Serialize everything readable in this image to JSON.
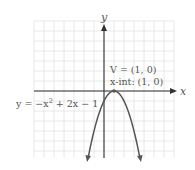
{
  "chart_data": {
    "type": "line",
    "title": "",
    "xlabel": "x",
    "ylabel": "y",
    "xlim": [
      -7,
      7
    ],
    "ylim": [
      -6.7,
      7
    ],
    "grid": true,
    "grid_step": 1,
    "series": [
      {
        "name": "y = -x^2 + 2x - 1",
        "equation": "y = -(x - 1)^2",
        "x": [
          -1.6,
          -1,
          0,
          1,
          2,
          3,
          3.6
        ],
        "y": [
          -6.76,
          -4,
          -1,
          0,
          -1,
          -4,
          -6.76
        ]
      }
    ],
    "annotations": [
      {
        "text": "V = (1, 0)",
        "x": 1,
        "y": 0
      },
      {
        "text": "x-int: (1, 0)",
        "x": 1,
        "y": 0
      }
    ],
    "equation_label": "y = −x² + 2x − 1"
  },
  "labels": {
    "y_axis": "y",
    "x_axis": "x",
    "vertex": "V = (1, 0)",
    "x_intercept": "x-int: (1, 0)",
    "eq_prefix": "y = −x",
    "eq_exp": "2",
    "eq_suffix": " + 2x − 1"
  },
  "colors": {
    "grid": "#e2e2e2",
    "axis": "#333333",
    "curve": "#555555",
    "text": "#555555"
  }
}
